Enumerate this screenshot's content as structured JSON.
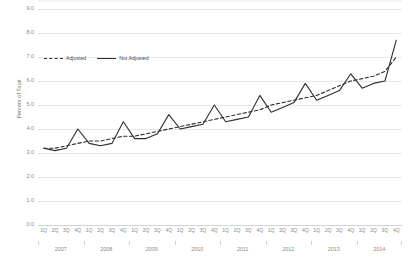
{
  "chart_data": {
    "type": "line",
    "title": "",
    "xlabel": "",
    "ylabel": "Percent of Total",
    "ylim": [
      0.0,
      9.0
    ],
    "y_ticks": [
      "0.0",
      "1.0",
      "2.0",
      "3.0",
      "4.0",
      "5.0",
      "6.0",
      "7.0",
      "8.0",
      "9.0"
    ],
    "grid": true,
    "legend_position": "upper-left-inside",
    "quarter_labels": [
      "1Q",
      "2Q",
      "3Q",
      "4Q"
    ],
    "years": [
      "2007",
      "2008",
      "2009",
      "2010",
      "2011",
      "2012",
      "2013",
      "2014"
    ],
    "categories": [
      "1Q 2007",
      "2Q 2007",
      "3Q 2007",
      "4Q 2007",
      "1Q 2008",
      "2Q 2008",
      "3Q 2008",
      "4Q 2008",
      "1Q 2009",
      "2Q 2009",
      "3Q 2009",
      "4Q 2009",
      "1Q 2010",
      "2Q 2010",
      "3Q 2010",
      "4Q 2010",
      "1Q 2011",
      "2Q 2011",
      "3Q 2011",
      "4Q 2011",
      "1Q 2012",
      "2Q 2012",
      "3Q 2012",
      "4Q 2012",
      "1Q 2013",
      "2Q 2013",
      "3Q 2013",
      "4Q 2013",
      "1Q 2014",
      "2Q 2014",
      "3Q 2014",
      "4Q 2014"
    ],
    "series": [
      {
        "name": "Adjusted",
        "style": "dashed",
        "color": "#2e2e2e",
        "values": [
          3.2,
          3.2,
          3.3,
          3.4,
          3.5,
          3.5,
          3.6,
          3.7,
          3.7,
          3.8,
          3.9,
          4.0,
          4.1,
          4.2,
          4.3,
          4.4,
          4.5,
          4.6,
          4.7,
          4.8,
          5.0,
          5.1,
          5.2,
          5.3,
          5.4,
          5.6,
          5.8,
          6.0,
          6.1,
          6.2,
          6.4,
          7.0
        ]
      },
      {
        "name": "Not Adjusted",
        "style": "solid",
        "color": "#2e2e2e",
        "values": [
          3.2,
          3.1,
          3.2,
          4.0,
          3.4,
          3.3,
          3.4,
          4.3,
          3.6,
          3.6,
          3.8,
          4.6,
          4.0,
          4.1,
          4.2,
          5.0,
          4.3,
          4.4,
          4.5,
          5.4,
          4.7,
          4.9,
          5.1,
          5.9,
          5.2,
          5.4,
          5.6,
          6.3,
          5.7,
          5.9,
          6.0,
          7.7
        ]
      }
    ]
  }
}
